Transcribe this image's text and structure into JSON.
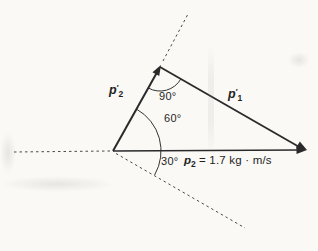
{
  "colors": {
    "background": "#faf9f6",
    "line": "#2a2a2a",
    "dashed": "#4a4a4a",
    "text": "#1f1f1f"
  },
  "labels": {
    "p2_prime": {
      "base": "p",
      "prime": "′",
      "sub": "2"
    },
    "p1_prime": {
      "base": "p",
      "prime": "′",
      "sub": "1"
    },
    "p2_equation": {
      "base": "p",
      "sub": "2",
      "value": "= 1.7 kg · m/s"
    }
  },
  "angles": {
    "apex": "90°",
    "upper": "60°",
    "lower": "30°"
  }
}
